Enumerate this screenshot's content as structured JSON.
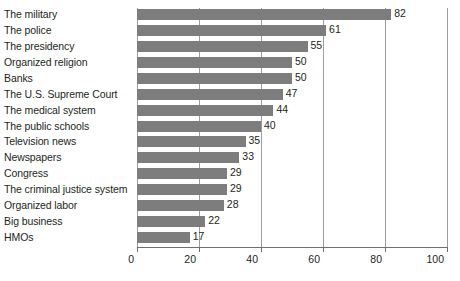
{
  "chart_data": {
    "type": "bar",
    "orientation": "horizontal",
    "title": "",
    "subtitle": "",
    "xlabel": "",
    "ylabel": "",
    "xlim": [
      0,
      100
    ],
    "xticks": [
      0,
      20,
      40,
      60,
      80,
      100
    ],
    "xtick_labels": [
      "0",
      "20",
      "40",
      "60",
      "80",
      "100"
    ],
    "grid": true,
    "grid_axis": "x",
    "legend": false,
    "legend_position": "none",
    "bar_color": "#7d7d7d",
    "gridline_color": "#9d9d9d",
    "text_color": "#231f20",
    "background": "#ffffff",
    "show_value_labels": true,
    "categories": [
      "The military",
      "The police",
      "The presidency",
      "Organized religion",
      "Banks",
      "The U.S. Supreme Court",
      "The medical system",
      "The public schools",
      "Television news",
      "Newspapers",
      "Congress",
      "The criminal justice system",
      "Organized labor",
      "Big business",
      "HMOs"
    ],
    "values": [
      82,
      61,
      55,
      50,
      50,
      47,
      44,
      40,
      35,
      33,
      29,
      29,
      28,
      22,
      17
    ],
    "value_labels": [
      "82",
      "61",
      "55",
      "50",
      "50",
      "47",
      "44",
      "40",
      "35",
      "33",
      "29",
      "29",
      "28",
      "22",
      "17"
    ]
  }
}
